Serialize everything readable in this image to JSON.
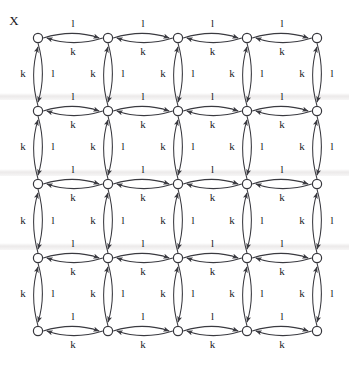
{
  "figure": {
    "name": "automaton-transition-grid",
    "corner_label": "X",
    "background_color": "#ffffff",
    "node_color": "#ffffff",
    "node_stroke_color": "#36363c",
    "edge_color": "#3a3a40",
    "label_color": "#1b1b1f"
  },
  "chart_data": {
    "type": "diagram",
    "title": "X",
    "rows": 5,
    "cols": 5,
    "node_radius": 4.6,
    "node_x": [
      38,
      108,
      178,
      247,
      317
    ],
    "node_y": [
      38,
      111,
      184,
      258,
      331
    ],
    "nodes": [
      {
        "id": "n00",
        "row": 0,
        "col": 0,
        "x": 38,
        "y": 38
      },
      {
        "id": "n01",
        "row": 0,
        "col": 1,
        "x": 108,
        "y": 38
      },
      {
        "id": "n02",
        "row": 0,
        "col": 2,
        "x": 178,
        "y": 38
      },
      {
        "id": "n03",
        "row": 0,
        "col": 3,
        "x": 247,
        "y": 38
      },
      {
        "id": "n04",
        "row": 0,
        "col": 4,
        "x": 317,
        "y": 38
      },
      {
        "id": "n10",
        "row": 1,
        "col": 0,
        "x": 38,
        "y": 111
      },
      {
        "id": "n11",
        "row": 1,
        "col": 1,
        "x": 108,
        "y": 111
      },
      {
        "id": "n12",
        "row": 1,
        "col": 2,
        "x": 178,
        "y": 111
      },
      {
        "id": "n13",
        "row": 1,
        "col": 3,
        "x": 247,
        "y": 111
      },
      {
        "id": "n14",
        "row": 1,
        "col": 4,
        "x": 317,
        "y": 111
      },
      {
        "id": "n20",
        "row": 2,
        "col": 0,
        "x": 38,
        "y": 184
      },
      {
        "id": "n21",
        "row": 2,
        "col": 1,
        "x": 108,
        "y": 184
      },
      {
        "id": "n22",
        "row": 2,
        "col": 2,
        "x": 178,
        "y": 184
      },
      {
        "id": "n23",
        "row": 2,
        "col": 3,
        "x": 247,
        "y": 184
      },
      {
        "id": "n24",
        "row": 2,
        "col": 4,
        "x": 317,
        "y": 184
      },
      {
        "id": "n30",
        "row": 3,
        "col": 0,
        "x": 38,
        "y": 258
      },
      {
        "id": "n31",
        "row": 3,
        "col": 1,
        "x": 108,
        "y": 258
      },
      {
        "id": "n32",
        "row": 3,
        "col": 2,
        "x": 178,
        "y": 258
      },
      {
        "id": "n33",
        "row": 3,
        "col": 3,
        "x": 247,
        "y": 258
      },
      {
        "id": "n34",
        "row": 3,
        "col": 4,
        "x": 317,
        "y": 258
      },
      {
        "id": "n40",
        "row": 4,
        "col": 0,
        "x": 38,
        "y": 331
      },
      {
        "id": "n41",
        "row": 4,
        "col": 1,
        "x": 108,
        "y": 331
      },
      {
        "id": "n42",
        "row": 4,
        "col": 2,
        "x": 178,
        "y": 331
      },
      {
        "id": "n43",
        "row": 4,
        "col": 3,
        "x": 247,
        "y": 331
      },
      {
        "id": "n44",
        "row": 4,
        "col": 4,
        "x": 317,
        "y": 331
      }
    ],
    "edge_labels": {
      "horizontal_upper": "l",
      "horizontal_lower": "k",
      "vertical_left": "k",
      "vertical_right": "l"
    },
    "alphabet": [
      "k",
      "l"
    ],
    "horizontal_edge_count": 20,
    "vertical_edge_count": 20,
    "arcs_per_edge": 2,
    "total_arcs": 80,
    "grid_bands_y": [
      96,
      172,
      246
    ]
  }
}
